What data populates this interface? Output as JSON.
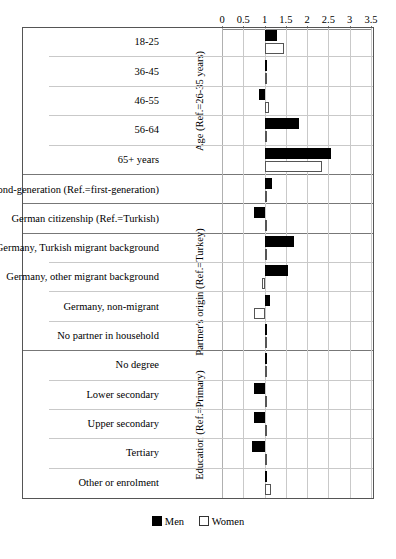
{
  "chart_data": {
    "type": "bar",
    "orientation": "horizontal",
    "title": "",
    "xlabel": "",
    "ylabel": "",
    "xlim": [
      0,
      3.5
    ],
    "xticks": [
      0,
      0.5,
      1,
      1.5,
      2,
      2.5,
      3,
      3.5
    ],
    "xtick_labels": [
      "0",
      "0.5",
      "1",
      "1.5",
      "2",
      "2.5",
      "3",
      "3.5"
    ],
    "baseline": 1,
    "grid": true,
    "legend_position": "bottom",
    "legend": [
      {
        "name": "Men",
        "style": "filled-black"
      },
      {
        "name": "Women",
        "style": "open-white"
      }
    ],
    "series": [
      {
        "name": "Men",
        "values": [
          1.3,
          1.02,
          0.88,
          1.8,
          2.55,
          1.18,
          0.74,
          1.7,
          1.55,
          1.12,
          1.02,
          1.06,
          0.75,
          0.76,
          0.7,
          1.02
        ]
      },
      {
        "name": "Women",
        "values": [
          1.46,
          1.0,
          1.1,
          1.05,
          2.35,
          1.0,
          1.0,
          1.03,
          0.95,
          0.76,
          1.0,
          1.0,
          1.0,
          1.0,
          1.0,
          1.16
        ]
      }
    ],
    "categories": [
      "18-25",
      "36-45",
      "46-55",
      "56-64",
      "65+ years",
      "Second-generation (Ref.=first-generation)",
      "German citizenship (Ref.=Turkish)",
      "Germany, Turkish migrant background",
      "Germany, other migrant background",
      "Germany, non-migrant",
      "No partner in household",
      "No degree",
      "Lower secondary",
      "Upper secondary",
      "Tertiary",
      "Other or enrolment"
    ],
    "sections": [
      {
        "title": "Age (Ref.=26-35 years)",
        "rows": [
          {
            "label": "18-25",
            "men": 1.3,
            "women": 1.46
          },
          {
            "label": "36-45",
            "men": 1.02,
            "women": 1.0
          },
          {
            "label": "46-55",
            "men": 0.88,
            "women": 1.1
          },
          {
            "label": "56-64",
            "men": 1.8,
            "women": 1.05
          },
          {
            "label": "65+ years",
            "men": 2.55,
            "women": 2.35
          }
        ]
      },
      {
        "title": "",
        "rows": [
          {
            "label": "Second-generation (Ref.=first-generation)",
            "men": 1.18,
            "women": 1.0
          }
        ]
      },
      {
        "title": "",
        "rows": [
          {
            "label": "German citizenship (Ref.=Turkish)",
            "men": 0.74,
            "women": 1.0
          }
        ]
      },
      {
        "title": "Partner's origin (Ref.=Turkey)",
        "rows": [
          {
            "label": "Germany, Turkish migrant background",
            "men": 1.7,
            "women": 1.03
          },
          {
            "label": "Germany, other migrant background",
            "men": 1.55,
            "women": 0.95
          },
          {
            "label": "Germany, non-migrant",
            "men": 1.12,
            "women": 0.76
          },
          {
            "label": "No partner in household",
            "men": 1.02,
            "women": 1.0
          }
        ]
      },
      {
        "title": "Education (Ref.=Primary)",
        "rows": [
          {
            "label": "No degree",
            "men": 1.06,
            "women": 1.0
          },
          {
            "label": "Lower secondary",
            "men": 0.75,
            "women": 1.0
          },
          {
            "label": "Upper secondary",
            "men": 0.76,
            "women": 1.0
          },
          {
            "label": "Tertiary",
            "men": 0.7,
            "women": 1.0
          },
          {
            "label": "Other or enrolment",
            "men": 1.02,
            "women": 1.16
          }
        ]
      }
    ]
  }
}
